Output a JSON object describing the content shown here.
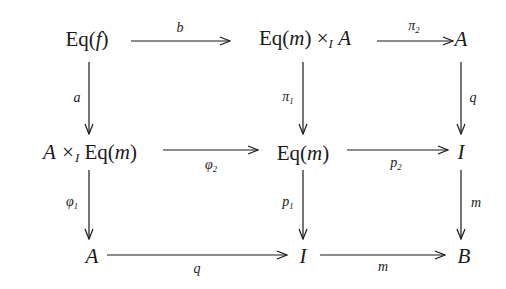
{
  "diagram": {
    "type": "commutative-diagram",
    "nodes": {
      "eq_f": "Eq(f)",
      "eq_m_times_a": "Eq(m) ×_I A",
      "a_top": "A",
      "a_times_eq_m": "A ×_I Eq(m)",
      "eq_m": "Eq(m)",
      "i_mid": "I",
      "a_bottom": "A",
      "i_bottom": "I",
      "b": "B"
    },
    "node_parts": {
      "eq_f": {
        "pre": "Eq(",
        "var": "f",
        "post": ")"
      },
      "eq_m_times_a": {
        "pre": "Eq(",
        "var": "m",
        "mid": ") ×",
        "sub": "I",
        "post": "A"
      },
      "a_top": "A",
      "a_times_eq_m": {
        "pre": "A ×",
        "sub": "I",
        "mid": "Eq(",
        "var": "m",
        "post": ")"
      },
      "eq_m": {
        "pre": "Eq(",
        "var": "m",
        "post": ")"
      },
      "i_mid": "I",
      "a_bottom": "A",
      "i_bottom": "I",
      "b": "B"
    },
    "arrows": [
      {
        "from": "eq_f",
        "to": "eq_m_times_a",
        "label": "b"
      },
      {
        "from": "eq_m_times_a",
        "to": "a_top",
        "label": "π",
        "label_sub": "2"
      },
      {
        "from": "eq_f",
        "to": "a_times_eq_m",
        "label": "a"
      },
      {
        "from": "eq_m_times_a",
        "to": "eq_m",
        "label": "π",
        "label_sub": "1"
      },
      {
        "from": "a_top",
        "to": "i_mid",
        "label": "q"
      },
      {
        "from": "a_times_eq_m",
        "to": "eq_m",
        "label": "φ",
        "label_sub": "2"
      },
      {
        "from": "eq_m",
        "to": "i_mid",
        "label": "p",
        "label_sub": "2"
      },
      {
        "from": "a_times_eq_m",
        "to": "a_bottom",
        "label": "φ",
        "label_sub": "1"
      },
      {
        "from": "eq_m",
        "to": "i_bottom",
        "label": "p",
        "label_sub": "1"
      },
      {
        "from": "i_mid",
        "to": "b",
        "label": "m"
      },
      {
        "from": "a_bottom",
        "to": "i_bottom",
        "label": "q"
      },
      {
        "from": "i_bottom",
        "to": "b",
        "label": "m"
      }
    ]
  }
}
